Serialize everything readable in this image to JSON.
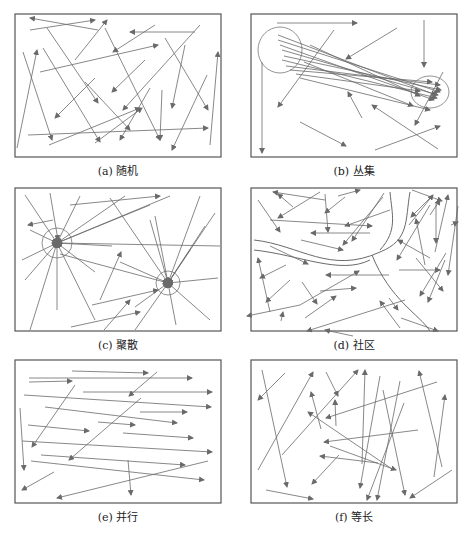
{
  "figure": {
    "colors": {
      "frame": "#555555",
      "line": "#6a6a6a",
      "circle": "#777777"
    },
    "panels": [
      {
        "id": "a",
        "caption": "(a) 随机",
        "pattern": "random",
        "box": [
          15,
          14,
          206,
          143
        ],
        "lines": [
          [
            98,
            30,
            30,
            18
          ],
          [
            30,
            30,
            95,
            20
          ],
          [
            105,
            28,
            160,
            140
          ],
          [
            75,
            60,
            107,
            20
          ],
          [
            155,
            25,
            113,
            52
          ],
          [
            195,
            32,
            130,
            32
          ],
          [
            40,
            72,
            158,
            45
          ],
          [
            17,
            148,
            37,
            50
          ],
          [
            23,
            52,
            52,
            140
          ],
          [
            43,
            48,
            100,
            142
          ],
          [
            47,
            28,
            98,
            103
          ],
          [
            95,
            78,
            55,
            118
          ],
          [
            145,
            60,
            112,
            92
          ],
          [
            200,
            25,
            123,
            110
          ],
          [
            185,
            45,
            172,
            108
          ],
          [
            165,
            38,
            208,
            110
          ],
          [
            85,
            82,
            130,
            130
          ],
          [
            95,
            143,
            142,
            108
          ],
          [
            150,
            88,
            120,
            140
          ],
          [
            28,
            135,
            208,
            128
          ],
          [
            49,
            145,
            140,
            108
          ],
          [
            162,
            90,
            160,
            140
          ],
          [
            207,
            75,
            172,
            150
          ],
          [
            210,
            145,
            218,
            52
          ]
        ]
      },
      {
        "id": "b",
        "caption": "(b) 丛集",
        "pattern": "clustered",
        "box": [
          251,
          14,
          206,
          143
        ],
        "ellipses": [
          [
            280,
            50,
            36,
            38
          ],
          [
            430,
            92,
            30,
            24
          ]
        ],
        "lines": [
          [
            277,
            23,
            357,
            23
          ],
          [
            424,
            20,
            424,
            67
          ],
          [
            262,
            62,
            262,
            153
          ],
          [
            334,
            30,
            278,
            107
          ],
          [
            397,
            28,
            346,
            59
          ],
          [
            300,
            122,
            346,
            146
          ],
          [
            362,
            118,
            348,
            92
          ],
          [
            438,
            149,
            372,
            105
          ],
          [
            375,
            150,
            440,
            126
          ],
          [
            443,
            72,
            415,
            125
          ],
          [
            278,
            35,
            436,
            95
          ],
          [
            278,
            40,
            440,
            92
          ],
          [
            280,
            45,
            434,
            100
          ],
          [
            282,
            50,
            438,
            95
          ],
          [
            284,
            56,
            441,
            90
          ],
          [
            282,
            60,
            437,
            98
          ],
          [
            286,
            66,
            440,
            85
          ],
          [
            290,
            70,
            432,
            82
          ],
          [
            296,
            74,
            420,
            91
          ],
          [
            300,
            78,
            430,
            110
          ],
          [
            304,
            62,
            413,
            106
          ],
          [
            310,
            45,
            420,
            96
          ]
        ]
      },
      {
        "id": "c",
        "caption": "(c) 聚散",
        "pattern": "gathering-scattering",
        "box": [
          15,
          188,
          206,
          143
        ],
        "circles": [
          [
            57,
            243,
            15
          ],
          [
            168,
            283,
            12
          ]
        ],
        "lines": [
          [
            50,
            193,
            58,
            240
          ],
          [
            25,
            195,
            57,
            243
          ],
          [
            30,
            230,
            57,
            243
          ],
          [
            22,
            260,
            57,
            243
          ],
          [
            25,
            280,
            57,
            243
          ],
          [
            30,
            330,
            57,
            243
          ],
          [
            57,
            310,
            57,
            243
          ],
          [
            95,
            320,
            57,
            243
          ],
          [
            125,
            196,
            57,
            243
          ],
          [
            112,
            246,
            57,
            243
          ],
          [
            95,
            272,
            57,
            243
          ],
          [
            80,
            196,
            57,
            243
          ],
          [
            170,
            196,
            57,
            243
          ],
          [
            220,
            246,
            57,
            243
          ],
          [
            150,
            205,
            57,
            243
          ],
          [
            53,
            220,
            28,
            225
          ],
          [
            70,
            205,
            160,
            196
          ],
          [
            200,
            196,
            168,
            283
          ],
          [
            215,
            213,
            168,
            283
          ],
          [
            205,
            226,
            168,
            283
          ],
          [
            150,
            220,
            168,
            283
          ],
          [
            120,
            262,
            168,
            283
          ],
          [
            135,
            307,
            168,
            283
          ],
          [
            190,
            250,
            168,
            283
          ],
          [
            218,
            278,
            168,
            283
          ],
          [
            210,
            320,
            168,
            283
          ],
          [
            176,
            325,
            168,
            283
          ],
          [
            135,
            330,
            168,
            283
          ],
          [
            110,
            198,
            168,
            283
          ],
          [
            155,
            216,
            168,
            283
          ],
          [
            60,
            254,
            168,
            283
          ],
          [
            100,
            300,
            121,
            252
          ],
          [
            92,
            305,
            158,
            290
          ],
          [
            71,
            327,
            140,
            312
          ],
          [
            104,
            330,
            130,
            300
          ]
        ]
      },
      {
        "id": "d",
        "caption": "(d) 社区",
        "pattern": "community",
        "box": [
          251,
          188,
          206,
          143
        ],
        "curves": [
          "M254,240 C300,245 330,275 380,252 C410,240 405,220 410,192",
          "M254,250 C300,255 340,275 370,260",
          "M372,255 C390,300 420,315 430,331",
          "M390,192 C392,215 398,230 380,250"
        ],
        "lines": [
          [
            325,
            200,
            273,
            192
          ],
          [
            293,
            207,
            278,
            194
          ],
          [
            320,
            192,
            278,
            218
          ],
          [
            345,
            197,
            325,
            213
          ],
          [
            325,
            194,
            328,
            232
          ],
          [
            338,
            196,
            360,
            190
          ],
          [
            258,
            200,
            280,
            232
          ],
          [
            270,
            220,
            372,
            226
          ],
          [
            301,
            240,
            343,
            250
          ],
          [
            370,
            233,
            311,
            233
          ],
          [
            383,
            197,
            343,
            245
          ],
          [
            384,
            193,
            352,
            241
          ],
          [
            390,
            210,
            345,
            226
          ],
          [
            409,
            225,
            433,
            195
          ],
          [
            412,
            190,
            442,
            201
          ],
          [
            433,
            195,
            411,
            217
          ],
          [
            430,
            205,
            397,
            260
          ],
          [
            430,
            215,
            440,
            200
          ],
          [
            436,
            203,
            436,
            243
          ],
          [
            425,
            265,
            416,
            219
          ],
          [
            435,
            252,
            448,
            195
          ],
          [
            451,
            225,
            458,
            222
          ],
          [
            458,
            206,
            448,
            275
          ],
          [
            445,
            260,
            428,
            302
          ],
          [
            446,
            253,
            420,
            296
          ],
          [
            430,
            258,
            398,
            240
          ],
          [
            416,
            258,
            443,
            291
          ],
          [
            399,
            270,
            440,
            270
          ],
          [
            270,
            246,
            308,
            264
          ],
          [
            286,
            265,
            260,
            278
          ],
          [
            290,
            280,
            266,
            302
          ],
          [
            270,
            312,
            258,
            258
          ],
          [
            302,
            282,
            317,
            304
          ],
          [
            305,
            318,
            336,
            296
          ],
          [
            300,
            305,
            359,
            271
          ],
          [
            320,
            291,
            356,
            288
          ],
          [
            353,
            336,
            325,
            330
          ],
          [
            389,
            275,
            326,
            275
          ],
          [
            405,
            300,
            307,
            331
          ],
          [
            389,
            298,
            398,
            310
          ],
          [
            400,
            328,
            380,
            301
          ],
          [
            401,
            318,
            438,
            331
          ],
          [
            300,
            305,
            247,
            316
          ],
          [
            281,
            321,
            283,
            312
          ]
        ]
      },
      {
        "id": "e",
        "caption": "(e) 并行",
        "pattern": "parallel",
        "box": [
          15,
          360,
          206,
          143
        ],
        "lines": [
          [
            72,
            371,
            148,
            373
          ],
          [
            29,
            378,
            192,
            378
          ],
          [
            29,
            382,
            72,
            381
          ],
          [
            83,
            392,
            212,
            392
          ],
          [
            24,
            395,
            211,
            407
          ],
          [
            45,
            407,
            177,
            423
          ],
          [
            28,
            425,
            89,
            431
          ],
          [
            98,
            422,
            135,
            425
          ],
          [
            140,
            412,
            187,
            412
          ],
          [
            123,
            433,
            193,
            438
          ],
          [
            22,
            441,
            212,
            452
          ],
          [
            41,
            455,
            185,
            465
          ],
          [
            31,
            461,
            204,
            480
          ],
          [
            20,
            408,
            24,
            470
          ],
          [
            128,
            460,
            131,
            495
          ],
          [
            157,
            372,
            129,
            396
          ],
          [
            75,
            385,
            32,
            447
          ],
          [
            141,
            398,
            69,
            460
          ],
          [
            54,
            472,
            22,
            490
          ],
          [
            208,
            461,
            57,
            498
          ]
        ]
      },
      {
        "id": "f",
        "caption": "(f) 等长",
        "pattern": "equal-length",
        "box": [
          251,
          360,
          206,
          143
        ],
        "lines": [
          [
            262,
            370,
            287,
            487
          ],
          [
            285,
            373,
            258,
            400
          ],
          [
            258,
            470,
            313,
            372
          ],
          [
            326,
            372,
            338,
            396
          ],
          [
            282,
            455,
            358,
            370
          ],
          [
            321,
            429,
            311,
            392
          ],
          [
            339,
            455,
            312,
            484
          ],
          [
            336,
            426,
            335,
            400
          ],
          [
            362,
            464,
            365,
            370
          ],
          [
            380,
            376,
            360,
            488
          ],
          [
            400,
            381,
            377,
            500
          ],
          [
            383,
            390,
            405,
            495
          ],
          [
            404,
            403,
            367,
            500
          ],
          [
            330,
            446,
            396,
            470
          ],
          [
            418,
            430,
            324,
            442
          ],
          [
            437,
            382,
            326,
            418
          ],
          [
            442,
            467,
            419,
            371
          ],
          [
            434,
            477,
            445,
            395
          ],
          [
            452,
            470,
            410,
            498
          ],
          [
            392,
            469,
            308,
            412
          ],
          [
            378,
            463,
            320,
            456
          ],
          [
            266,
            490,
            313,
            499
          ]
        ]
      }
    ]
  }
}
